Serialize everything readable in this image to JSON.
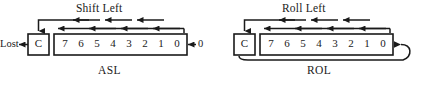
{
  "figure": {
    "title_asl": "Shift Left",
    "title_rol": "Roll Left",
    "caption_asl": "ASL",
    "caption_rol": "ROL"
  },
  "asl": {
    "operation_label": "Shift Left",
    "name_label": "ASL",
    "discard_label": "Lost",
    "carry_label": "C",
    "fill_in_label": "0",
    "bits": [
      "7",
      "6",
      "5",
      "4",
      "3",
      "2",
      "1",
      "0"
    ],
    "carry_out_icon": "arrow-left-icon",
    "fill_in_icon": "arrow-left-icon",
    "shift_arrow_icon": "arrow-left-icon",
    "carry_drop_icon": "arrow-down-icon"
  },
  "rol": {
    "operation_label": "Roll Left",
    "name_label": "ROL",
    "carry_label": "C",
    "bits": [
      "7",
      "6",
      "5",
      "4",
      "3",
      "2",
      "1",
      "0"
    ],
    "feedback_icon": "loop-arrow-icon",
    "shift_arrow_icon": "arrow-left-icon",
    "carry_drop_icon": "arrow-down-icon"
  },
  "style": {
    "stroke": "#1a1a1a",
    "background": "#ffffff"
  }
}
